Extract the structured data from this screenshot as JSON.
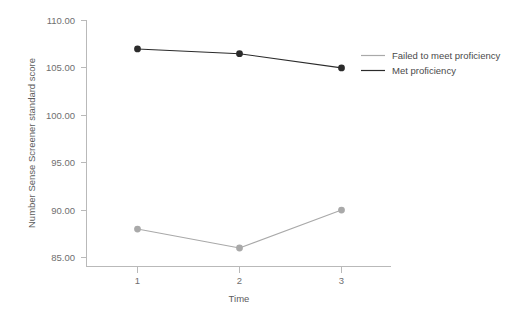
{
  "chart_data": {
    "type": "line",
    "title": "",
    "xlabel": "Time",
    "ylabel": "Number Sense Screener standard score",
    "x": [
      1,
      2,
      3
    ],
    "categories": [
      "1",
      "2",
      "3"
    ],
    "xtick_labels": [
      "1",
      "2",
      "3"
    ],
    "ytick_labels": [
      "110.00",
      "105.00",
      "100.00",
      "95.00",
      "90.00",
      "85.00"
    ],
    "ytick_values": [
      110,
      105,
      100,
      95,
      90,
      85
    ],
    "ylim": [
      85,
      110
    ],
    "xlim": [
      0.5,
      3.5
    ],
    "grid": false,
    "legend_position": "right",
    "series": [
      {
        "name": "Failed to meet proficiency",
        "values": [
          88,
          86,
          90
        ],
        "color": "#a9a9a9",
        "marker": "circle"
      },
      {
        "name": "Met proficiency",
        "values": [
          107,
          106.5,
          105
        ],
        "color": "#2b2b2b",
        "marker": "circle"
      }
    ]
  },
  "legend": {
    "items": [
      {
        "label": "Failed to meet proficiency",
        "color": "#a9a9a9"
      },
      {
        "label": "Met proficiency",
        "color": "#2b2b2b"
      }
    ]
  },
  "axes": {
    "x_title": "Time",
    "y_title": "Number Sense Screener standard score",
    "x_ticks": [
      "1",
      "2",
      "3"
    ],
    "y_ticks": [
      "110.00",
      "105.00",
      "100.00",
      "95.00",
      "90.00",
      "85.00"
    ]
  },
  "colors": {
    "axis": "#b9b9b9",
    "tick_text": "#6f6f6f",
    "title_text": "#5c5c5c",
    "legend_text": "#4a4a4a",
    "series_light": "#a9a9a9",
    "series_dark": "#2b2b2b",
    "background": "#ffffff"
  }
}
